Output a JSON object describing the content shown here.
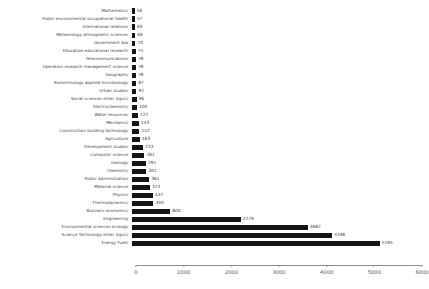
{
  "chart_data": {
    "type": "bar",
    "orientation": "horizontal",
    "title": "",
    "subtitle": "",
    "xlabel": "",
    "ylabel": "",
    "xlim": [
      0,
      6000
    ],
    "xticks": [
      0,
      1000,
      2000,
      3000,
      4000,
      5000,
      6000
    ],
    "xtick_labels": [
      "0",
      "1000",
      "2000",
      "3000",
      "4000",
      "5000",
      "6000"
    ],
    "grid": false,
    "legend": null,
    "bar_color": "#141414",
    "value_labels_shown": true,
    "categories": [
      "Mathematics",
      "Public environmental occupational health",
      "International relations",
      "Meteorology atmospheric sciences",
      "Government law",
      "Education educational research",
      "Telecommunications",
      "Operation research management science",
      "Geography",
      "Biotechnology applied microbiology",
      "Urban studies",
      "Social sciences other topics",
      "Electrochemistry",
      "Water resources",
      "Mechanics",
      "Construction building technology",
      "Agriculture",
      "Development studies",
      "Computer science",
      "Geology",
      "Chemistry",
      "Public administration",
      "Material science",
      "Physics",
      "Thermodynamics",
      "Business economics",
      "Engineering",
      "Environmental sciences ecology",
      "Science Technology other topics",
      "Energy Fuels"
    ],
    "values": [
      56,
      57,
      60,
      66,
      70,
      75,
      78,
      78,
      78,
      87,
      92,
      96,
      100,
      122,
      143,
      152,
      163,
      233,
      261,
      291,
      301,
      361,
      373,
      437,
      450,
      800,
      2279,
      3682,
      4196,
      5195
    ],
    "value_label_texts": [
      "56",
      "57",
      "60",
      "66",
      "70",
      "75",
      "78",
      "78",
      "78",
      "87",
      "92",
      "96",
      "100",
      "122",
      "143",
      "152",
      "163",
      "233",
      "261",
      "291",
      "301",
      "361",
      "373",
      "437",
      "450",
      "800",
      "2279",
      "3682",
      "4196",
      "5195"
    ]
  }
}
